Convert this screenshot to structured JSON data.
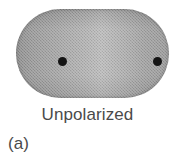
{
  "figure": {
    "panel_label": "(a)",
    "caption": "Unpolarized",
    "diagram": {
      "object_name": "polarizing-slab",
      "shape": "stadium",
      "markers": [
        {
          "name": "left-marker-dot",
          "label": ""
        },
        {
          "name": "right-marker-dot",
          "label": ""
        }
      ]
    },
    "colors": {
      "slab_dark": "#8f8f8f",
      "slab_mid": "#a6a6a6",
      "slab_light": "#bdbdbd",
      "marker": "#141414",
      "text": "#4a4a4a",
      "background": "#ffffff"
    }
  }
}
